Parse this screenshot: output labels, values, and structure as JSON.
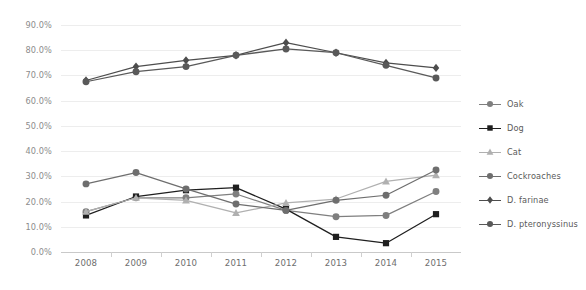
{
  "chart_data": {
    "type": "line",
    "title": "",
    "subtitle": "",
    "xlabel": "",
    "ylabel": "",
    "x": [
      "2008",
      "2009",
      "2010",
      "2011",
      "2012",
      "2013",
      "2014",
      "2015"
    ],
    "categories": [
      "2008",
      "2009",
      "2010",
      "2011",
      "2012",
      "2013",
      "2014",
      "2015"
    ],
    "ylim": [
      0,
      90
    ],
    "ytick_values": [
      0,
      10,
      20,
      30,
      40,
      50,
      60,
      70,
      80,
      90
    ],
    "ytick_labels": [
      "0.0%",
      "10.0%",
      "20.0%",
      "30.0%",
      "40.0%",
      "50.0%",
      "60.0%",
      "70.0%",
      "80.0%",
      "90.0%"
    ],
    "grid": true,
    "grid_axis": "y",
    "legend_position": "right",
    "series": [
      {
        "name": "Oak",
        "marker": "circle",
        "color": "#7f7f7f",
        "values": [
          16.0,
          21.5,
          21.5,
          23.0,
          16.5,
          14.0,
          14.5,
          24.0
        ]
      },
      {
        "name": "Dog",
        "marker": "square",
        "color": "#1f1f1f",
        "values": [
          14.5,
          22.0,
          24.5,
          25.5,
          17.0,
          6.0,
          3.5,
          15.0
        ]
      },
      {
        "name": "Cat",
        "marker": "triangle",
        "color": "#b0b0b0",
        "values": [
          16.0,
          21.5,
          20.5,
          15.5,
          19.5,
          21.0,
          28.0,
          30.5
        ]
      },
      {
        "name": "Cockroaches",
        "marker": "circle",
        "color": "#6e6e6e",
        "values": [
          27.0,
          31.5,
          25.0,
          19.0,
          16.5,
          20.5,
          22.5,
          32.5
        ]
      },
      {
        "name": "D. farinae",
        "marker": "diamond",
        "color": "#4d4d4d",
        "values": [
          68.0,
          73.5,
          76.0,
          78.0,
          83.0,
          79.0,
          75.0,
          73.0
        ]
      },
      {
        "name": "D. pteronyssinus",
        "marker": "circle",
        "color": "#595959",
        "values": [
          67.5,
          71.5,
          73.5,
          78.0,
          80.5,
          79.0,
          74.0,
          69.0
        ]
      }
    ]
  },
  "legend": {
    "items": [
      {
        "label": "Oak"
      },
      {
        "label": "Dog"
      },
      {
        "label": "Cat"
      },
      {
        "label": "Cockroaches"
      },
      {
        "label": "D. farinae"
      },
      {
        "label": "D. pteronyssinus"
      }
    ]
  },
  "colors": {
    "background": "#ffffff",
    "gridline": "#ededed",
    "axis": "#c9c9c9",
    "ytick_text": "#8c8c8c",
    "xtick_text": "#6e6e6e",
    "legend_text": "#5a5a5a"
  }
}
